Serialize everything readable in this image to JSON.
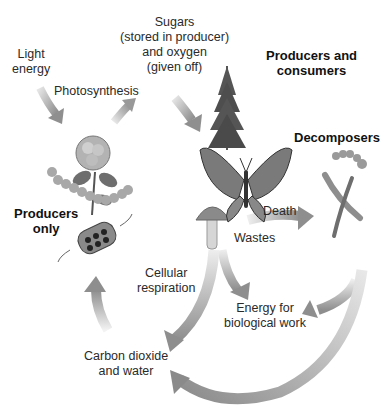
{
  "diagram": {
    "title": "",
    "colors": {
      "arrow": "#9a9a9a",
      "arrow_light": "#d6d6d6",
      "text": "#2a2a2a",
      "background": "#ffffff"
    },
    "labels": {
      "light_energy": [
        "Light",
        "energy"
      ],
      "photosynthesis": "Photosynthesis",
      "sugars": [
        "Sugars",
        "(stored in producer)",
        "and oxygen",
        "(given off)"
      ],
      "producers_and_consumers": [
        "Producers and",
        "consumers"
      ],
      "decomposers": "Decomposers",
      "producers_only": [
        "Producers",
        "only"
      ],
      "death": "Death",
      "wastes": "Wastes",
      "cellular_respiration": [
        "Cellular",
        "respiration"
      ],
      "energy_for_work": [
        "Energy for",
        "biological work"
      ],
      "carbon_dioxide_water": [
        "Carbon dioxide",
        "and water"
      ]
    },
    "nodes": [
      {
        "id": "producers-only",
        "illustration": "rose-plant-algae-icon"
      },
      {
        "id": "producers-and-consumers",
        "illustration": "tree-butterfly-mushroom-icon"
      },
      {
        "id": "decomposers",
        "illustration": "worm-bacteria-icon"
      }
    ],
    "edges": [
      {
        "from": "light-energy",
        "to": "producers-only"
      },
      {
        "from": "producers-only",
        "to": "sugars-oxygen",
        "label": "Photosynthesis"
      },
      {
        "from": "sugars-oxygen",
        "to": "producers-and-consumers"
      },
      {
        "from": "producers-and-consumers",
        "to": "decomposers",
        "label": "Death / Wastes"
      },
      {
        "from": "producers-and-consumers",
        "to": "energy-for-biological-work"
      },
      {
        "from": "producers-and-consumers",
        "to": "carbon-dioxide-and-water",
        "label": "Cellular respiration"
      },
      {
        "from": "decomposers",
        "to": "energy-for-biological-work"
      },
      {
        "from": "decomposers",
        "to": "carbon-dioxide-and-water"
      },
      {
        "from": "carbon-dioxide-and-water",
        "to": "producers-only"
      }
    ]
  }
}
